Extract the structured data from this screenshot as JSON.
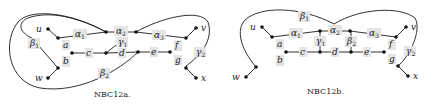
{
  "diagrams": [
    {
      "id": "NBC12a",
      "caption": "NBC12a.",
      "vertex_labels": [
        "u",
        "v",
        "w",
        "x"
      ],
      "edge_labels": [
        "α1",
        "α2",
        "α3",
        "β1",
        "β2",
        "γ1",
        "γ2",
        "a",
        "b",
        "c",
        "d",
        "e",
        "f",
        "g"
      ]
    },
    {
      "id": "NBC12b",
      "caption": "NBC12b.",
      "vertex_labels": [
        "u",
        "v",
        "w",
        "x"
      ],
      "edge_labels": [
        "α1",
        "α2",
        "α3",
        "β1",
        "β2",
        "γ1",
        "γ2",
        "a",
        "b",
        "c",
        "d",
        "e",
        "f",
        "g"
      ]
    }
  ],
  "labels": {
    "u": "u",
    "v": "v",
    "w": "w",
    "x": "x",
    "alpha": "α",
    "beta": "β",
    "gamma": "γ",
    "a": "a",
    "b": "b",
    "c": "c",
    "d": "d",
    "e": "e",
    "f": "f",
    "g": "g",
    "one": "1",
    "two": "2",
    "three": "3"
  },
  "captions": {
    "left": "NBC12a.",
    "right": "NBC12b."
  },
  "colors": {
    "edge": "#1a1a1a",
    "label_bg": "#e4e4e4",
    "node": "#111111"
  }
}
